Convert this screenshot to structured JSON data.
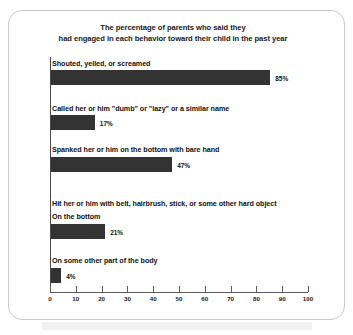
{
  "chart_data": {
    "type": "bar",
    "orientation": "horizontal",
    "title": "The percentage of parents who said they had engaged in each behavior toward their child in the past year",
    "title_lines": [
      "The percentage of parents who said they",
      "had engaged in each behavior toward their child in the past year"
    ],
    "xlabel": "",
    "ylabel": "",
    "xlim": [
      0,
      100
    ],
    "xticks": [
      0,
      10,
      20,
      30,
      40,
      50,
      60,
      70,
      80,
      90,
      100
    ],
    "xtick_labels": [
      "0",
      "10",
      "20",
      "30",
      "40",
      "50",
      "60",
      "70",
      "80",
      "90",
      "100"
    ],
    "grid": false,
    "legend": "none",
    "bar_color": "#333333",
    "categories": [
      "Shouted, yelled, or screamed",
      "Called her or him \"dumb\" or \"lazy\" or a similar name",
      "Spanked her or him on the bottom with bare hand",
      "On the bottom",
      "On some other part of the body"
    ],
    "values": [
      85,
      17,
      47,
      21,
      4
    ],
    "value_labels": [
      "85%",
      "17%",
      "47%",
      "21%",
      "4%"
    ],
    "group_headings": [
      {
        "text": "Hit her or him with belt, hairbrush, stick, or some other hard object",
        "before_category_index": 3
      }
    ],
    "items": [
      {
        "label": "Shouted, yelled, or screamed",
        "value": 85,
        "value_label": "85%",
        "label_y": 59,
        "bar_y": 70
      },
      {
        "label": "Called her or him \"dumb\" or \"lazy\" or a similar name",
        "value": 17,
        "value_label": "17%",
        "label_y": 104,
        "bar_y": 115
      },
      {
        "label": "Spanked her or him on the bottom with bare hand",
        "value": 47,
        "value_label": "47%",
        "label_y": 145,
        "bar_y": 157
      },
      {
        "label": "Hit her or him with belt, hairbrush, stick, or some other hard object",
        "value": null,
        "value_label": "",
        "label_y": 199,
        "bar_y": null
      },
      {
        "label": "On the bottom",
        "value": 21,
        "value_label": "21%",
        "label_y": 212,
        "bar_y": 224
      },
      {
        "label": "On some other part of the body",
        "value": 4,
        "value_label": "4%",
        "label_y": 256,
        "bar_y": 268
      }
    ]
  }
}
